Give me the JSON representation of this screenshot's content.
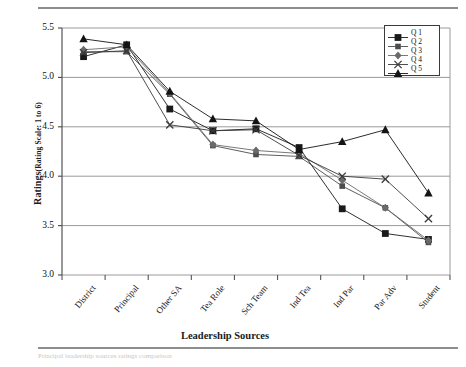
{
  "figure": {
    "footnote": "Principal leadership sources ratings comparison",
    "y_axis_title_main": "Ratings",
    "y_axis_title_note": "(Rating Scale: 1 to 6)",
    "x_axis_title": "Leadership Sources"
  },
  "chart_data": {
    "type": "line",
    "title": "",
    "xlabel": "Leadership Sources",
    "ylabel": "Ratings (Rating Scale: 1 to 6)",
    "ylim": [
      3.0,
      5.5
    ],
    "yticks": [
      "3.0",
      "3.5",
      "4.0",
      "4.5",
      "5.0",
      "5.5"
    ],
    "ytick_values": [
      3.0,
      3.5,
      4.0,
      4.5,
      5.0,
      5.5
    ],
    "grid": true,
    "legend_position": "top-right",
    "categories": [
      "District",
      "Principal",
      "Other SA",
      "Tea Role",
      "Sch Team",
      "Ind Tea",
      "Ind Par",
      "Par Adv",
      "Student"
    ],
    "series": [
      {
        "name": "Q 1",
        "marker": "square-filled",
        "color": "#1a1a1a",
        "values": [
          5.21,
          5.33,
          4.68,
          4.46,
          4.48,
          4.29,
          3.67,
          3.42,
          3.36
        ]
      },
      {
        "name": "Q 2",
        "marker": "square-small",
        "color": "#4d4d4d",
        "values": [
          5.26,
          5.26,
          4.83,
          4.31,
          4.22,
          4.2,
          3.9,
          3.68,
          3.33
        ]
      },
      {
        "name": "Q 3",
        "marker": "diamond",
        "color": "#6a6a6a",
        "values": [
          5.28,
          5.31,
          4.84,
          4.32,
          4.26,
          4.23,
          3.96,
          3.68,
          3.35
        ]
      },
      {
        "name": "Q 4",
        "marker": "cross-x",
        "color": "#3a3a3a",
        "values": [
          5.25,
          5.27,
          4.52,
          4.46,
          4.47,
          4.21,
          4.0,
          3.97,
          3.57
        ]
      },
      {
        "name": "Q 5",
        "marker": "triangle-filled",
        "color": "#141414",
        "values": [
          5.39,
          5.33,
          4.86,
          4.58,
          4.56,
          4.27,
          4.35,
          4.47,
          3.83
        ]
      }
    ]
  },
  "legend": {
    "items": [
      {
        "label": "Q 1"
      },
      {
        "label": "Q 2"
      },
      {
        "label": "Q 3"
      },
      {
        "label": "Q 4"
      },
      {
        "label": "Q 5"
      }
    ]
  }
}
